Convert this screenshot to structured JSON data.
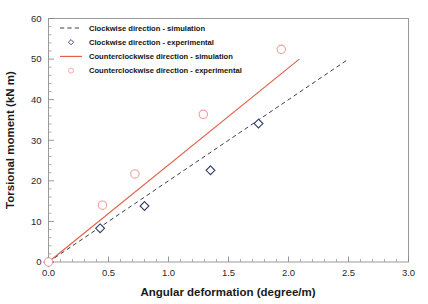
{
  "chart_data": {
    "type": "scatter",
    "title": "",
    "xlabel": "Angular deformation (degree/m)",
    "ylabel": "Torsional moment (kN m)",
    "xlim": [
      0.0,
      3.0
    ],
    "ylim": [
      0,
      60
    ],
    "xticks": [
      "0.0",
      "0.5",
      "1.0",
      "1.5",
      "2.0",
      "2.5",
      "3.0"
    ],
    "xtick_values": [
      0.0,
      0.5,
      1.0,
      1.5,
      2.0,
      2.5,
      3.0
    ],
    "yticks": [
      "0",
      "10",
      "20",
      "30",
      "40",
      "50",
      "60"
    ],
    "ytick_values": [
      0,
      10,
      20,
      30,
      40,
      50,
      60
    ],
    "grid": false,
    "legend_position": "top-left",
    "series": [
      {
        "name": "Clockwise direction - simulation",
        "style": "dashed-line",
        "color": "#3b3b5c",
        "x": [
          0.0,
          2.5
        ],
        "y": [
          0.0,
          50.0
        ]
      },
      {
        "name": "Clockwise direction - experimental",
        "style": "open-diamond",
        "color": "#2f3a66",
        "x": [
          0.0,
          0.43,
          0.8,
          1.35,
          1.75
        ],
        "y": [
          0.0,
          8.3,
          13.8,
          22.6,
          34.1
        ]
      },
      {
        "name": "Counterclockwise direction - simulation",
        "style": "solid-line",
        "color": "#e06048",
        "x": [
          0.0,
          2.09
        ],
        "y": [
          0.0,
          50.0
        ]
      },
      {
        "name": "Counterclockwise direction - experimental",
        "style": "open-circle",
        "color": "#f0a0a0",
        "x": [
          0.0,
          0.45,
          0.72,
          1.29,
          1.94
        ],
        "y": [
          0.0,
          14.0,
          21.7,
          36.4,
          52.4
        ]
      }
    ]
  },
  "legend": {
    "entries": [
      {
        "label": "Clockwise direction - simulation",
        "marker": "dashed-line-swatch"
      },
      {
        "label": "Clockwise direction - experimental",
        "marker": "diamond-swatch"
      },
      {
        "label": "Counterclockwise direction - simulation",
        "marker": "solid-line-swatch"
      },
      {
        "label": "Counterclockwise direction - experimental",
        "marker": "circle-swatch"
      }
    ]
  },
  "colors": {
    "clockwise": "#2f3a66",
    "counterclockwise_line": "#e06048",
    "counterclockwise_marker": "#f0a0a0",
    "axis": "#9a9a9a",
    "text": "#141414"
  }
}
